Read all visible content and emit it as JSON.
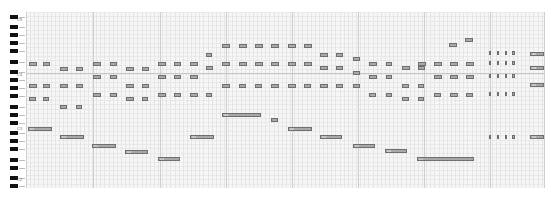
{
  "app": {
    "type": "piano-roll editor"
  },
  "keyboard": {
    "black_keys_y": [
      15,
      25,
      33,
      41,
      49,
      60,
      70,
      78,
      86,
      94,
      105,
      113,
      121,
      131,
      139,
      147,
      158,
      166,
      176,
      184
    ],
    "octave_labels": [
      {
        "text": "C5",
        "y": 18
      },
      {
        "text": "C4",
        "y": 73
      },
      {
        "text": "C3",
        "y": 127
      },
      {
        "text": "C2",
        "y": 178
      }
    ]
  },
  "grid": {
    "bar_lines_x": [
      26,
      93,
      160,
      226,
      292,
      358,
      424,
      490,
      544
    ],
    "divider_line_y": 73
  },
  "notes": [
    {
      "x": 29,
      "y": 62,
      "w": 8,
      "label": "E4"
    },
    {
      "x": 43,
      "y": 62,
      "w": 7,
      "label": "E4"
    },
    {
      "x": 60,
      "y": 67,
      "w": 8,
      "label": "D4"
    },
    {
      "x": 76,
      "y": 67,
      "w": 7,
      "label": "D4"
    },
    {
      "x": 29,
      "y": 84,
      "w": 8,
      "label": "A3"
    },
    {
      "x": 43,
      "y": 84,
      "w": 7,
      "label": "A3"
    },
    {
      "x": 60,
      "y": 84,
      "w": 8,
      "label": "A3"
    },
    {
      "x": 76,
      "y": 84,
      "w": 7,
      "label": "A3"
    },
    {
      "x": 29,
      "y": 97,
      "w": 7,
      "label": "F3"
    },
    {
      "x": 43,
      "y": 97,
      "w": 6,
      "label": "F3"
    },
    {
      "x": 60,
      "y": 105,
      "w": 7,
      "label": "D3"
    },
    {
      "x": 76,
      "y": 105,
      "w": 6,
      "label": "D3"
    },
    {
      "x": 93,
      "y": 62,
      "w": 8,
      "label": "E4"
    },
    {
      "x": 110,
      "y": 62,
      "w": 7,
      "label": "E4"
    },
    {
      "x": 126,
      "y": 67,
      "w": 8,
      "label": "D4"
    },
    {
      "x": 142,
      "y": 67,
      "w": 7,
      "label": "D4"
    },
    {
      "x": 93,
      "y": 75,
      "w": 8,
      "label": "B3"
    },
    {
      "x": 110,
      "y": 75,
      "w": 7,
      "label": "B3"
    },
    {
      "x": 126,
      "y": 84,
      "w": 8,
      "label": "A3"
    },
    {
      "x": 142,
      "y": 84,
      "w": 7,
      "label": "A3"
    },
    {
      "x": 93,
      "y": 93,
      "w": 8,
      "label": "G3"
    },
    {
      "x": 110,
      "y": 93,
      "w": 7,
      "label": "G3"
    },
    {
      "x": 126,
      "y": 97,
      "w": 8,
      "label": "F3"
    },
    {
      "x": 142,
      "y": 97,
      "w": 6,
      "label": "F3"
    },
    {
      "x": 158,
      "y": 62,
      "w": 8,
      "label": "E4"
    },
    {
      "x": 174,
      "y": 62,
      "w": 7,
      "label": "E4"
    },
    {
      "x": 190,
      "y": 62,
      "w": 8,
      "label": "E4"
    },
    {
      "x": 206,
      "y": 53,
      "w": 6,
      "label": "G4"
    },
    {
      "x": 158,
      "y": 75,
      "w": 8,
      "label": "B3"
    },
    {
      "x": 174,
      "y": 75,
      "w": 7,
      "label": "B3"
    },
    {
      "x": 190,
      "y": 75,
      "w": 8,
      "label": "B3"
    },
    {
      "x": 206,
      "y": 66,
      "w": 7,
      "label": "D4"
    },
    {
      "x": 158,
      "y": 93,
      "w": 8,
      "label": "G3"
    },
    {
      "x": 174,
      "y": 93,
      "w": 7,
      "label": "G3"
    },
    {
      "x": 190,
      "y": 93,
      "w": 8,
      "label": "G3"
    },
    {
      "x": 206,
      "y": 93,
      "w": 6,
      "label": "G3"
    },
    {
      "x": 190,
      "y": 75,
      "w": 8,
      "label": "B3"
    },
    {
      "x": 222,
      "y": 44,
      "w": 8,
      "label": "B4"
    },
    {
      "x": 239,
      "y": 44,
      "w": 8,
      "label": "B4"
    },
    {
      "x": 255,
      "y": 44,
      "w": 8,
      "label": "B4"
    },
    {
      "x": 271,
      "y": 44,
      "w": 8,
      "label": "B4"
    },
    {
      "x": 288,
      "y": 44,
      "w": 8,
      "label": "B4"
    },
    {
      "x": 304,
      "y": 44,
      "w": 8,
      "label": "B4"
    },
    {
      "x": 222,
      "y": 62,
      "w": 8,
      "label": "E4"
    },
    {
      "x": 239,
      "y": 62,
      "w": 8,
      "label": "E4"
    },
    {
      "x": 255,
      "y": 62,
      "w": 8,
      "label": "E4"
    },
    {
      "x": 271,
      "y": 62,
      "w": 8,
      "label": "E4"
    },
    {
      "x": 288,
      "y": 62,
      "w": 8,
      "label": "E4"
    },
    {
      "x": 304,
      "y": 62,
      "w": 8,
      "label": "E4"
    },
    {
      "x": 222,
      "y": 84,
      "w": 8,
      "label": "A3"
    },
    {
      "x": 239,
      "y": 84,
      "w": 7,
      "label": "A3"
    },
    {
      "x": 255,
      "y": 84,
      "w": 7,
      "label": "A3"
    },
    {
      "x": 271,
      "y": 84,
      "w": 8,
      "label": "A3"
    },
    {
      "x": 288,
      "y": 84,
      "w": 8,
      "label": "A3"
    },
    {
      "x": 304,
      "y": 84,
      "w": 7,
      "label": "A3"
    },
    {
      "x": 320,
      "y": 53,
      "w": 8,
      "label": "G4"
    },
    {
      "x": 336,
      "y": 53,
      "w": 7,
      "label": "G4"
    },
    {
      "x": 320,
      "y": 66,
      "w": 8,
      "label": "D4"
    },
    {
      "x": 336,
      "y": 66,
      "w": 7,
      "label": "D4"
    },
    {
      "x": 320,
      "y": 84,
      "w": 8,
      "label": "A3"
    },
    {
      "x": 336,
      "y": 84,
      "w": 7,
      "label": "A3"
    },
    {
      "x": 353,
      "y": 57,
      "w": 7,
      "label": "F4"
    },
    {
      "x": 353,
      "y": 71,
      "w": 7,
      "label": "C4"
    },
    {
      "x": 353,
      "y": 84,
      "w": 7,
      "label": "A3"
    },
    {
      "x": 369,
      "y": 62,
      "w": 8,
      "label": "E4"
    },
    {
      "x": 386,
      "y": 62,
      "w": 6,
      "label": "E4"
    },
    {
      "x": 369,
      "y": 75,
      "w": 8,
      "label": "B3"
    },
    {
      "x": 386,
      "y": 75,
      "w": 6,
      "label": "B3"
    },
    {
      "x": 369,
      "y": 93,
      "w": 7,
      "label": "G3"
    },
    {
      "x": 386,
      "y": 93,
      "w": 6,
      "label": "G3"
    },
    {
      "x": 402,
      "y": 66,
      "w": 8,
      "label": "D4"
    },
    {
      "x": 418,
      "y": 66,
      "w": 7,
      "label": "D4"
    },
    {
      "x": 402,
      "y": 84,
      "w": 7,
      "label": "A3"
    },
    {
      "x": 418,
      "y": 84,
      "w": 6,
      "label": "A3"
    },
    {
      "x": 402,
      "y": 97,
      "w": 7,
      "label": "F3"
    },
    {
      "x": 418,
      "y": 97,
      "w": 6,
      "label": "F3"
    },
    {
      "x": 418,
      "y": 62,
      "w": 8,
      "label": "E4"
    },
    {
      "x": 434,
      "y": 62,
      "w": 8,
      "label": "E4"
    },
    {
      "x": 450,
      "y": 62,
      "w": 8,
      "label": "E4"
    },
    {
      "x": 466,
      "y": 62,
      "w": 8,
      "label": "E4"
    },
    {
      "x": 434,
      "y": 75,
      "w": 8,
      "label": "B3"
    },
    {
      "x": 450,
      "y": 75,
      "w": 8,
      "label": "B3"
    },
    {
      "x": 466,
      "y": 75,
      "w": 8,
      "label": "B3"
    },
    {
      "x": 434,
      "y": 93,
      "w": 7,
      "label": "G3"
    },
    {
      "x": 450,
      "y": 93,
      "w": 8,
      "label": "G3"
    },
    {
      "x": 466,
      "y": 93,
      "w": 7,
      "label": "G3"
    },
    {
      "x": 449,
      "y": 43,
      "w": 8,
      "label": "B4"
    },
    {
      "x": 465,
      "y": 38,
      "w": 8,
      "label": "D5"
    },
    {
      "x": 489,
      "y": 51,
      "w": 2,
      "label": "A4"
    },
    {
      "x": 497,
      "y": 51,
      "w": 2,
      "label": "A4"
    },
    {
      "x": 505,
      "y": 51,
      "w": 2,
      "label": "A4"
    },
    {
      "x": 512,
      "y": 51,
      "w": 3,
      "label": "A4"
    },
    {
      "x": 489,
      "y": 61,
      "w": 2,
      "label": "E4"
    },
    {
      "x": 497,
      "y": 61,
      "w": 2,
      "label": "E4"
    },
    {
      "x": 505,
      "y": 61,
      "w": 2,
      "label": "E4"
    },
    {
      "x": 512,
      "y": 61,
      "w": 3,
      "label": "E4"
    },
    {
      "x": 489,
      "y": 74,
      "w": 2,
      "label": "B3"
    },
    {
      "x": 497,
      "y": 74,
      "w": 2,
      "label": "B3"
    },
    {
      "x": 505,
      "y": 74,
      "w": 2,
      "label": "B3"
    },
    {
      "x": 512,
      "y": 74,
      "w": 3,
      "label": "B3"
    },
    {
      "x": 489,
      "y": 92,
      "w": 2,
      "label": "G3"
    },
    {
      "x": 497,
      "y": 92,
      "w": 2,
      "label": "G3"
    },
    {
      "x": 505,
      "y": 92,
      "w": 2,
      "label": "G3"
    },
    {
      "x": 512,
      "y": 92,
      "w": 3,
      "label": "G3"
    },
    {
      "x": 489,
      "y": 135,
      "w": 2,
      "label": "G2"
    },
    {
      "x": 497,
      "y": 135,
      "w": 2,
      "label": "G2"
    },
    {
      "x": 505,
      "y": 135,
      "w": 2,
      "label": "G2"
    },
    {
      "x": 512,
      "y": 135,
      "w": 3,
      "label": "G2"
    },
    {
      "x": 530,
      "y": 52,
      "w": 14,
      "label": "A4"
    },
    {
      "x": 530,
      "y": 66,
      "w": 14,
      "label": "D4"
    },
    {
      "x": 530,
      "y": 83,
      "w": 14,
      "label": "A3"
    },
    {
      "x": 530,
      "y": 135,
      "w": 14,
      "label": "G2"
    },
    {
      "x": 28,
      "y": 127,
      "w": 24,
      "label": "A2"
    },
    {
      "x": 60,
      "y": 135,
      "w": 24,
      "label": "G2"
    },
    {
      "x": 92,
      "y": 144,
      "w": 24,
      "label": "E2"
    },
    {
      "x": 125,
      "y": 150,
      "w": 23,
      "label": "D2"
    },
    {
      "x": 158,
      "y": 157,
      "w": 22,
      "label": "C2"
    },
    {
      "x": 190,
      "y": 135,
      "w": 24,
      "label": "G2"
    },
    {
      "x": 222,
      "y": 113,
      "w": 39,
      "label": "D3"
    },
    {
      "x": 271,
      "y": 118,
      "w": 7,
      "label": "C3"
    },
    {
      "x": 288,
      "y": 127,
      "w": 24,
      "label": "A2"
    },
    {
      "x": 320,
      "y": 135,
      "w": 22,
      "label": "G2"
    },
    {
      "x": 353,
      "y": 144,
      "w": 22,
      "label": "E2"
    },
    {
      "x": 385,
      "y": 149,
      "w": 22,
      "label": "D2"
    },
    {
      "x": 417,
      "y": 157,
      "w": 57,
      "label": "C2"
    }
  ]
}
